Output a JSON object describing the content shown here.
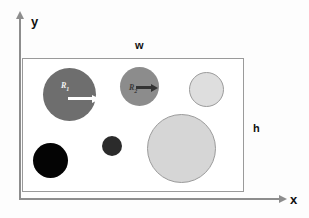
{
  "figure": {
    "type": "schematic-diagram"
  },
  "axes": {
    "x_label": "x",
    "y_label": "y",
    "x_arrow_icon": "arrow-right-icon",
    "y_arrow_icon": "arrow-up-icon",
    "color": "#8d8d8d"
  },
  "domain": {
    "name": "domain-rectangle",
    "width_label": "w",
    "height_label": "h",
    "border_color": "#9a9a9a",
    "fill_color": "#ffffff"
  },
  "circles": [
    {
      "id": "circle-1",
      "label": "R",
      "subscript": "1",
      "fill": "#6e6e6e",
      "has_arrow": true,
      "arrow_color": "#ffffff",
      "arrow_direction": "right"
    },
    {
      "id": "circle-2",
      "label": "R",
      "subscript": "2",
      "fill": "#8c8c8c",
      "has_arrow": true,
      "arrow_color": "#333333",
      "arrow_direction": "right"
    },
    {
      "id": "circle-3",
      "label": "",
      "subscript": "",
      "fill": "#dedede",
      "has_arrow": false,
      "arrow_color": "",
      "arrow_direction": ""
    },
    {
      "id": "circle-4",
      "label": "",
      "subscript": "",
      "fill": "#040404",
      "has_arrow": false,
      "arrow_color": "",
      "arrow_direction": ""
    },
    {
      "id": "circle-5",
      "label": "",
      "subscript": "",
      "fill": "#2b2b2b",
      "has_arrow": false,
      "arrow_color": "",
      "arrow_direction": ""
    },
    {
      "id": "circle-6",
      "label": "",
      "subscript": "",
      "fill": "#d6d6d6",
      "has_arrow": false,
      "arrow_color": "",
      "arrow_direction": ""
    }
  ]
}
